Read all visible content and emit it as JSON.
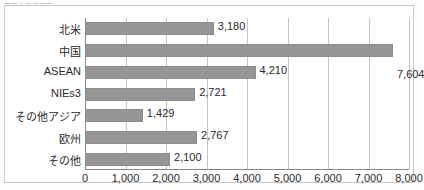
{
  "caption": {
    "text": "ーー・ーーーー"
  },
  "chart_data": {
    "type": "bar",
    "orientation": "horizontal",
    "title": "",
    "subtitle": "",
    "xlabel": "",
    "ylabel": "",
    "grid": true,
    "legend": "none",
    "xlim": [
      0,
      8000
    ],
    "xticks": [
      0,
      1000,
      2000,
      3000,
      4000,
      5000,
      6000,
      7000,
      8000
    ],
    "xtick_labels": [
      "0",
      "1,000",
      "2,000",
      "3,000",
      "4,000",
      "5,000",
      "6,000",
      "7,000",
      "8,000"
    ],
    "categories": [
      "北米",
      "中国",
      "ASEAN",
      "NIEs3",
      "その他アジア",
      "欧州",
      "その他"
    ],
    "values": [
      3180,
      7604,
      4210,
      2721,
      1429,
      2767,
      2100
    ],
    "value_labels": [
      "3,180",
      "7,604",
      "4,210",
      "2,721",
      "1,429",
      "2,767",
      "2,100"
    ],
    "bar_color": "#969696",
    "bar_border_color": "#8c8c8c",
    "grid_color": "#c5c5c5",
    "axis_color": "#8a8a8a",
    "text_color": "#2a2a2a"
  }
}
